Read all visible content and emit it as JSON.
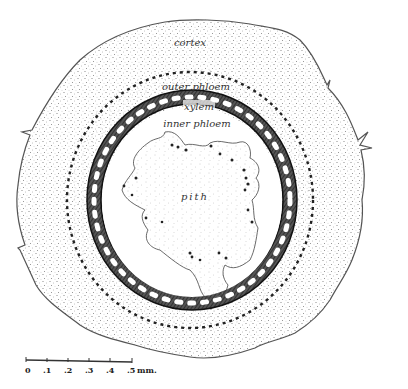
{
  "figure": {
    "type": "stem cross-section diagram",
    "labels": {
      "cortex": "cortex",
      "outer_phloem": "outer phloem",
      "xylem": "xylem",
      "inner_phloem": "inner phloem",
      "pith": "pith"
    },
    "scale_bar": {
      "ticks": [
        "0",
        ".1",
        ".2",
        ".3",
        ".4",
        ".5"
      ],
      "unit": "mm."
    },
    "colors": {
      "outline": "#555555",
      "stipple": "#777777",
      "xylem_ring": "#222222",
      "background": "#ffffff"
    }
  }
}
